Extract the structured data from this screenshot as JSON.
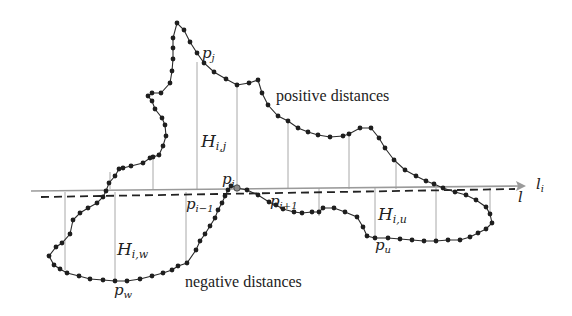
{
  "diagram": {
    "captions": {
      "positive": "positive distances",
      "negative": "negative distances"
    },
    "lines": {
      "reference_line": {
        "main": "l",
        "sub": "i"
      },
      "fitted_line": {
        "main": "l",
        "sub": ""
      }
    },
    "point_labels": [
      {
        "id": "pj",
        "main": "p",
        "sub": "j"
      },
      {
        "id": "pi",
        "main": "p",
        "sub": "i"
      },
      {
        "id": "pi-1",
        "main": "p",
        "sub": "i−1"
      },
      {
        "id": "pi+1",
        "main": "p",
        "sub": "i+1"
      },
      {
        "id": "pu",
        "main": "p",
        "sub": "u"
      },
      {
        "id": "pw",
        "main": "p",
        "sub": "w"
      }
    ],
    "distance_labels": [
      {
        "id": "Hij",
        "main": "H",
        "sub": "i,j"
      },
      {
        "id": "Hiu",
        "main": "H",
        "sub": "i,u"
      },
      {
        "id": "Hiw",
        "main": "H",
        "sub": "i,w"
      }
    ],
    "colors": {
      "curve": "#2a2a2a",
      "points": "#1e1e1e",
      "perpendiculars": "#a8a8a8",
      "reference_line": "#9a9a9a",
      "dashed_line": "#222222"
    }
  }
}
